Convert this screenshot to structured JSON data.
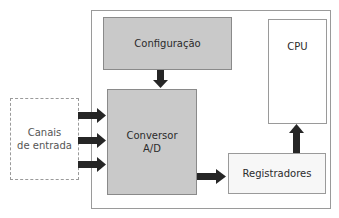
{
  "diagram": {
    "type": "block-diagram",
    "blocks": {
      "configuracao": {
        "label": "Configuração"
      },
      "conversor": {
        "line1": "Conversor",
        "line2": "A/D"
      },
      "cpu": {
        "label": "CPU"
      },
      "registradores": {
        "label": "Registradores"
      },
      "canais": {
        "line1": "Canais",
        "line2": "de entrada"
      }
    },
    "connections": [
      {
        "from": "Configuração",
        "to": "Conversor A/D",
        "direction": "down"
      },
      {
        "from": "Canais de entrada",
        "to": "Conversor A/D",
        "direction": "right",
        "count": 3
      },
      {
        "from": "Conversor A/D",
        "to": "Registradores",
        "direction": "right"
      },
      {
        "from": "Registradores",
        "to": "CPU",
        "direction": "up"
      }
    ],
    "colors": {
      "gray_block": "#c9c9c9",
      "light_block": "#f7f7f7",
      "border": "#9a9a9a",
      "arrow": "#262626"
    }
  }
}
